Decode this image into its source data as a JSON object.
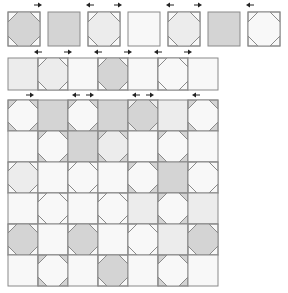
{
  "colors": {
    "gray": "#d4d4d4",
    "light": "#ececec",
    "white": "#f8f8f8",
    "border": "#8a8a8a",
    "arrow": "#222222"
  },
  "row1": [
    {
      "shape": "octagon",
      "fill": "gray",
      "corners": "white"
    },
    {
      "shape": "plain",
      "fill": "gray"
    },
    {
      "shape": "octagon",
      "fill": "light",
      "corners": "white"
    },
    {
      "shape": "plain",
      "fill": "white"
    },
    {
      "shape": "octagon",
      "fill": "light",
      "corners": "white"
    },
    {
      "shape": "plain",
      "fill": "gray"
    },
    {
      "shape": "octagon",
      "fill": "white",
      "corners": "white"
    }
  ],
  "row1_arrows": [
    {
      "dir": "right"
    },
    {
      "dir": "left"
    },
    {
      "dir": "right"
    },
    {
      "dir": "left"
    },
    {
      "dir": "right"
    },
    {
      "dir": "left"
    }
  ],
  "row2": [
    {
      "shape": "plain",
      "fill": "light"
    },
    {
      "shape": "octagon",
      "fill": "light",
      "corners": "white"
    },
    {
      "shape": "plain",
      "fill": "white"
    },
    {
      "shape": "octagon",
      "fill": "gray",
      "corners": "white"
    },
    {
      "shape": "plain",
      "fill": "white"
    },
    {
      "shape": "octagon",
      "fill": "white",
      "corners": "white"
    },
    {
      "shape": "plain",
      "fill": "white"
    }
  ],
  "row2_arrows_top": [
    "left",
    "right",
    "left",
    "right",
    "left",
    "right"
  ],
  "row2_arrows_bottom": [
    "right",
    "left",
    "right",
    "left",
    "right",
    "left"
  ],
  "grid_arrows_top": [
    "right",
    "left",
    "right",
    "left",
    "right",
    "left"
  ],
  "grid": [
    [
      {
        "shape": "octagon",
        "fill": "white",
        "corners": "gray"
      },
      {
        "shape": "plain",
        "fill": "gray"
      },
      {
        "shape": "octagon",
        "fill": "white",
        "corners": "gray"
      },
      {
        "shape": "plain",
        "fill": "gray"
      },
      {
        "shape": "octagon",
        "fill": "gray",
        "corners": "light"
      },
      {
        "shape": "plain",
        "fill": "light"
      },
      {
        "shape": "octagon",
        "fill": "white",
        "corners": "gray"
      }
    ],
    [
      {
        "shape": "plain",
        "fill": "white"
      },
      {
        "shape": "octagon",
        "fill": "white",
        "corners": "gray"
      },
      {
        "shape": "plain",
        "fill": "gray"
      },
      {
        "shape": "octagon",
        "fill": "light",
        "corners": "gray"
      },
      {
        "shape": "plain",
        "fill": "white"
      },
      {
        "shape": "octagon",
        "fill": "white",
        "corners": "gray"
      },
      {
        "shape": "plain",
        "fill": "white"
      }
    ],
    [
      {
        "shape": "octagon",
        "fill": "light",
        "corners": "white"
      },
      {
        "shape": "plain",
        "fill": "white"
      },
      {
        "shape": "octagon",
        "fill": "white",
        "corners": "white"
      },
      {
        "shape": "plain",
        "fill": "white"
      },
      {
        "shape": "octagon",
        "fill": "white",
        "corners": "gray"
      },
      {
        "shape": "plain",
        "fill": "gray"
      },
      {
        "shape": "octagon",
        "fill": "white",
        "corners": "white"
      }
    ],
    [
      {
        "shape": "plain",
        "fill": "white"
      },
      {
        "shape": "octagon",
        "fill": "white",
        "corners": "white"
      },
      {
        "shape": "plain",
        "fill": "white"
      },
      {
        "shape": "octagon",
        "fill": "white",
        "corners": "white"
      },
      {
        "shape": "plain",
        "fill": "light"
      },
      {
        "shape": "octagon",
        "fill": "white",
        "corners": "gray"
      },
      {
        "shape": "plain",
        "fill": "light"
      }
    ],
    [
      {
        "shape": "octagon",
        "fill": "gray",
        "corners": "white"
      },
      {
        "shape": "plain",
        "fill": "white"
      },
      {
        "shape": "octagon",
        "fill": "gray",
        "corners": "white"
      },
      {
        "shape": "plain",
        "fill": "white"
      },
      {
        "shape": "octagon",
        "fill": "white",
        "corners": "white"
      },
      {
        "shape": "plain",
        "fill": "light"
      },
      {
        "shape": "octagon",
        "fill": "gray",
        "corners": "white"
      }
    ],
    [
      {
        "shape": "plain",
        "fill": "white"
      },
      {
        "shape": "octagon",
        "fill": "white",
        "corners": "gray"
      },
      {
        "shape": "plain",
        "fill": "white"
      },
      {
        "shape": "octagon",
        "fill": "gray",
        "corners": "white"
      },
      {
        "shape": "plain",
        "fill": "white"
      },
      {
        "shape": "octagon",
        "fill": "white",
        "corners": "gray"
      },
      {
        "shape": "plain",
        "fill": "white"
      }
    ]
  ]
}
